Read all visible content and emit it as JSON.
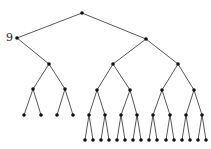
{
  "diagram": {
    "type": "binary-tree",
    "labels": [
      {
        "node": "n1",
        "text": "9"
      }
    ],
    "nodes": [
      {
        "id": "n0",
        "x": 82,
        "y": 13
      },
      {
        "id": "n1",
        "x": 17,
        "y": 38
      },
      {
        "id": "n2",
        "x": 146,
        "y": 39
      },
      {
        "id": "n3",
        "x": 49,
        "y": 64
      },
      {
        "id": "n4",
        "x": 113,
        "y": 64
      },
      {
        "id": "n5",
        "x": 178,
        "y": 64
      },
      {
        "id": "n6",
        "x": 33,
        "y": 89
      },
      {
        "id": "n7",
        "x": 65,
        "y": 89
      },
      {
        "id": "n8",
        "x": 24,
        "y": 115
      },
      {
        "id": "n9",
        "x": 41,
        "y": 115
      },
      {
        "id": "n10",
        "x": 57,
        "y": 115
      },
      {
        "id": "n11",
        "x": 73,
        "y": 115
      },
      {
        "id": "n12",
        "x": 97,
        "y": 90
      },
      {
        "id": "n13",
        "x": 130,
        "y": 90
      },
      {
        "id": "n14",
        "x": 162,
        "y": 90
      },
      {
        "id": "n15",
        "x": 194,
        "y": 90
      },
      {
        "id": "n16",
        "x": 89,
        "y": 115
      },
      {
        "id": "n17",
        "x": 105,
        "y": 115
      },
      {
        "id": "n18",
        "x": 121,
        "y": 115
      },
      {
        "id": "n19",
        "x": 137,
        "y": 115
      },
      {
        "id": "n20",
        "x": 153,
        "y": 115
      },
      {
        "id": "n21",
        "x": 170,
        "y": 115
      },
      {
        "id": "n22",
        "x": 186,
        "y": 115
      },
      {
        "id": "n23",
        "x": 202,
        "y": 115
      },
      {
        "id": "n24",
        "x": 85,
        "y": 140
      },
      {
        "id": "n25",
        "x": 93,
        "y": 140
      },
      {
        "id": "n26",
        "x": 101,
        "y": 140
      },
      {
        "id": "n27",
        "x": 109,
        "y": 140
      },
      {
        "id": "n28",
        "x": 117,
        "y": 140
      },
      {
        "id": "n29",
        "x": 125,
        "y": 140
      },
      {
        "id": "n30",
        "x": 133,
        "y": 140
      },
      {
        "id": "n31",
        "x": 141,
        "y": 140
      },
      {
        "id": "n32",
        "x": 149,
        "y": 140
      },
      {
        "id": "n33",
        "x": 157,
        "y": 140
      },
      {
        "id": "n34",
        "x": 166,
        "y": 140
      },
      {
        "id": "n35",
        "x": 174,
        "y": 140
      },
      {
        "id": "n36",
        "x": 182,
        "y": 140
      },
      {
        "id": "n37",
        "x": 190,
        "y": 140
      },
      {
        "id": "n38",
        "x": 198,
        "y": 140
      },
      {
        "id": "n39",
        "x": 206,
        "y": 140
      }
    ],
    "edges": [
      [
        "n0",
        "n1"
      ],
      [
        "n0",
        "n2"
      ],
      [
        "n1",
        "n3"
      ],
      [
        "n2",
        "n4"
      ],
      [
        "n2",
        "n5"
      ],
      [
        "n3",
        "n6"
      ],
      [
        "n3",
        "n7"
      ],
      [
        "n6",
        "n8"
      ],
      [
        "n6",
        "n9"
      ],
      [
        "n7",
        "n10"
      ],
      [
        "n7",
        "n11"
      ],
      [
        "n4",
        "n12"
      ],
      [
        "n4",
        "n13"
      ],
      [
        "n5",
        "n14"
      ],
      [
        "n5",
        "n15"
      ],
      [
        "n12",
        "n16"
      ],
      [
        "n12",
        "n17"
      ],
      [
        "n13",
        "n18"
      ],
      [
        "n13",
        "n19"
      ],
      [
        "n14",
        "n20"
      ],
      [
        "n14",
        "n21"
      ],
      [
        "n15",
        "n22"
      ],
      [
        "n15",
        "n23"
      ],
      [
        "n16",
        "n24"
      ],
      [
        "n16",
        "n25"
      ],
      [
        "n17",
        "n26"
      ],
      [
        "n17",
        "n27"
      ],
      [
        "n18",
        "n28"
      ],
      [
        "n18",
        "n29"
      ],
      [
        "n19",
        "n30"
      ],
      [
        "n19",
        "n31"
      ],
      [
        "n20",
        "n32"
      ],
      [
        "n20",
        "n33"
      ],
      [
        "n21",
        "n34"
      ],
      [
        "n21",
        "n35"
      ],
      [
        "n22",
        "n36"
      ],
      [
        "n22",
        "n37"
      ],
      [
        "n23",
        "n38"
      ],
      [
        "n23",
        "n39"
      ]
    ],
    "colors": {
      "edge": "#444444",
      "node": "#111111"
    }
  }
}
